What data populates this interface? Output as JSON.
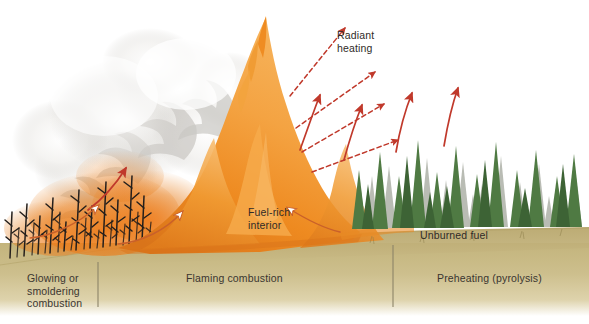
{
  "figure": {
    "type": "scientific-illustration",
    "canvas": {
      "width": 589,
      "height": 324
    },
    "background_color": "#ffffff"
  },
  "colors": {
    "ground_tan": "#cbbd8a",
    "ground_tan_dark": "#bfae74",
    "ground_tan_light": "#e6dcba",
    "flame_orange": "#ef8c22",
    "flame_orange_light": "#f5a94a",
    "flame_orange_deep": "#d9741a",
    "smoke_white": "#ffffff",
    "smoke_gray": "#cfcdc9",
    "arrow_red": "#c0392b",
    "tree_green": "#4f7a43",
    "tree_green_dark": "#3d6335",
    "tree_gray": "#b9bcb4",
    "burned_black": "#241f1c",
    "text_dark": "#3a3530",
    "divider": "#8c8468"
  },
  "zone_labels": [
    {
      "id": "glowing-smoldering",
      "text": "Glowing or\nsmoldering\ncombustion",
      "x": 27,
      "y": 272,
      "align": "left"
    },
    {
      "id": "flaming-combustion",
      "text": "Flaming combustion",
      "x": 186,
      "y": 272,
      "align": "left"
    },
    {
      "id": "preheating-pyrolysis",
      "text": "Preheating (pyrolysis)",
      "x": 437,
      "y": 272,
      "align": "left"
    }
  ],
  "dividers": [
    {
      "id": "divider-left",
      "x": 98,
      "y1": 262,
      "y2": 307
    },
    {
      "id": "divider-right",
      "x": 393,
      "y1": 245,
      "y2": 307
    }
  ],
  "annotations": [
    {
      "id": "radiant-heating",
      "text": "Radiant\nheating",
      "x": 337,
      "y": 29
    },
    {
      "id": "fuel-rich-interior",
      "text": "Fuel-rich\ninterior",
      "x": 248,
      "y": 206
    },
    {
      "id": "unburned-fuel",
      "text": "Unburned fuel",
      "x": 420,
      "y": 229
    }
  ],
  "arrows": {
    "radiant_dashed": [
      {
        "id": "radiant-dashed-1",
        "x1": 290,
        "y1": 96,
        "x2": 345,
        "y2": 28
      },
      {
        "id": "radiant-dashed-2",
        "x1": 296,
        "y1": 128,
        "x2": 375,
        "y2": 72
      },
      {
        "id": "radiant-dashed-3",
        "x1": 302,
        "y1": 152,
        "x2": 384,
        "y2": 104
      },
      {
        "id": "radiant-dashed-4",
        "x1": 312,
        "y1": 172,
        "x2": 398,
        "y2": 140
      }
    ],
    "convection_solid": [
      {
        "id": "convection-arrow-1",
        "x1": 88,
        "y1": 210,
        "x2": 126,
        "y2": 168
      },
      {
        "id": "convection-arrow-2",
        "x1": 300,
        "y1": 150,
        "x2": 320,
        "y2": 95
      },
      {
        "id": "convection-arrow-3",
        "x1": 344,
        "y1": 160,
        "x2": 362,
        "y2": 105
      },
      {
        "id": "convection-arrow-4",
        "x1": 396,
        "y1": 152,
        "x2": 412,
        "y2": 93
      },
      {
        "id": "convection-arrow-5",
        "x1": 444,
        "y1": 146,
        "x2": 458,
        "y2": 88
      }
    ],
    "indraft_outlined": [
      {
        "id": "indraft-arrow-left",
        "x1": 30,
        "y1": 238,
        "x2": 98,
        "y2": 206
      },
      {
        "id": "indraft-arrow-mid",
        "x1": 118,
        "y1": 244,
        "x2": 182,
        "y2": 212
      },
      {
        "id": "indraft-arrow-right",
        "x1": 340,
        "y1": 232,
        "x2": 288,
        "y2": 208
      }
    ]
  },
  "scene": {
    "burned_zone": {
      "label": "charred-tree-skeletons",
      "count": 22,
      "x_from": 6,
      "x_to": 152
    },
    "flame_zone": {
      "label": "main-flame-front",
      "peak_x": 265,
      "peak_y": 17
    },
    "smoke_zone": {
      "label": "smoke-plume",
      "x_from": 40,
      "x_to": 250
    },
    "forest_zone": {
      "label": "unburned-conifer-forest",
      "green_count": 19,
      "gray_count": 16,
      "x_from": 352,
      "x_to": 586
    }
  }
}
